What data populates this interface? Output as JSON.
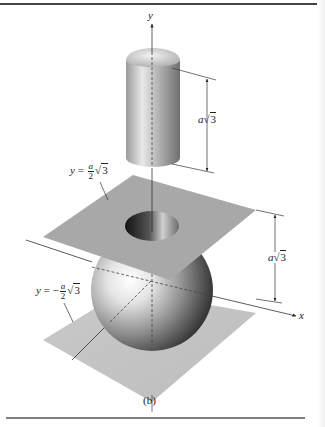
{
  "figure": {
    "caption": "(b)",
    "axes": {
      "y_label": "y",
      "x_label": "x"
    },
    "dimensions": {
      "cylinder_height": {
        "coef": "a",
        "radical": "3"
      },
      "slab_height": {
        "coef": "a",
        "radical": "3"
      }
    },
    "planes": {
      "upper": {
        "lhs": "y",
        "eq": "=",
        "sign": "",
        "num": "a",
        "den": "2",
        "radical": "3"
      },
      "lower": {
        "lhs": "y",
        "eq": "=",
        "sign": "−",
        "num": "a",
        "den": "2",
        "radical": "3"
      }
    },
    "colors": {
      "plane": "#a7a7a7",
      "plane_lower": "#c4c4c4",
      "ink": "#222222",
      "rule": "#555555"
    }
  }
}
